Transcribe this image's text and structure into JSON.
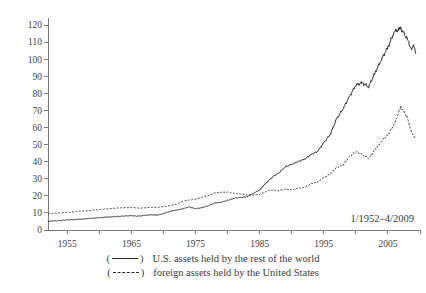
{
  "chart_data": {
    "type": "line",
    "title": "",
    "subtitle": "",
    "annotation": "1/1952–4/2009",
    "xlabel": "",
    "ylabel": "",
    "xlim": [
      1952,
      2010
    ],
    "ylim": [
      0,
      125
    ],
    "grid": false,
    "legend_position": "bottom-center",
    "yticks": [
      0,
      10,
      20,
      30,
      40,
      50,
      60,
      70,
      80,
      90,
      100,
      110,
      120
    ],
    "ytick_labels": [
      "0",
      "10",
      "20",
      "30",
      "40",
      "50",
      "60",
      "70",
      "80",
      "90",
      "100",
      "110",
      "120"
    ],
    "xticks": [
      1955,
      1960,
      1965,
      1970,
      1975,
      1980,
      1985,
      1990,
      1995,
      2000,
      2005,
      2010
    ],
    "xtick_labels": [
      "1955",
      "",
      "1965",
      "",
      "1975",
      "",
      "1985",
      "",
      "1995",
      "",
      "2005",
      ""
    ],
    "series": [
      {
        "name": "U.S. assets held by the rest of the world",
        "style": "solid",
        "x": [
          1952,
          1953,
          1954,
          1955,
          1956,
          1957,
          1958,
          1959,
          1960,
          1961,
          1962,
          1963,
          1964,
          1965,
          1966,
          1967,
          1968,
          1969,
          1970,
          1971,
          1972,
          1973,
          1974,
          1975,
          1976,
          1977,
          1978,
          1979,
          1980,
          1981,
          1982,
          1983,
          1984,
          1985,
          1986,
          1987,
          1988,
          1989,
          1990,
          1991,
          1992,
          1993,
          1994,
          1995,
          1996,
          1997,
          1998,
          1999,
          2000,
          2001,
          2002,
          2003,
          2004,
          2005,
          2006,
          2007,
          2008,
          2008.6,
          2009.0,
          2009.33
        ],
        "values": [
          5.1,
          5.3,
          5.6,
          5.9,
          6.1,
          6.3,
          6.6,
          6.9,
          7.2,
          7.5,
          7.7,
          7.9,
          8.2,
          8.4,
          8.1,
          8.5,
          8.9,
          8.7,
          9.5,
          11.0,
          11.6,
          12.4,
          13.5,
          12.5,
          13.0,
          14.2,
          15.8,
          16.2,
          17.3,
          18.6,
          19.0,
          19.4,
          21.4,
          23.5,
          27.5,
          31.0,
          33.5,
          37.0,
          38.5,
          40.0,
          41.5,
          44.0,
          46.0,
          51.0,
          56.0,
          65.0,
          71.0,
          78.0,
          85.0,
          86.0,
          84.0,
          92.0,
          100.0,
          107.0,
          116.0,
          118.0,
          112.0,
          106.0,
          108.0,
          103.5
        ]
      },
      {
        "name": "foreign assets held by the United States",
        "style": "dashed",
        "x": [
          1952,
          1953,
          1954,
          1955,
          1956,
          1957,
          1958,
          1959,
          1960,
          1961,
          1962,
          1963,
          1964,
          1965,
          1966,
          1967,
          1968,
          1969,
          1970,
          1971,
          1972,
          1973,
          1974,
          1975,
          1976,
          1977,
          1978,
          1979,
          1980,
          1981,
          1982,
          1983,
          1984,
          1985,
          1986,
          1987,
          1988,
          1989,
          1990,
          1991,
          1992,
          1993,
          1994,
          1995,
          1996,
          1997,
          1998,
          1999,
          2000,
          2001,
          2002,
          2003,
          2004,
          2005,
          2006,
          2007,
          2008,
          2008.6,
          2009.0,
          2009.33
        ],
        "values": [
          9.5,
          9.8,
          10.0,
          10.3,
          10.6,
          11.0,
          11.3,
          11.6,
          12.0,
          12.3,
          12.6,
          12.9,
          13.1,
          13.2,
          12.8,
          13.0,
          13.2,
          13.3,
          13.6,
          14.3,
          15.1,
          16.8,
          17.5,
          18.2,
          19.0,
          20.2,
          21.6,
          22.2,
          22.0,
          21.5,
          21.0,
          20.6,
          20.4,
          21.0,
          22.5,
          23.5,
          23.0,
          24.0,
          23.5,
          24.5,
          25.0,
          27.0,
          28.0,
          30.5,
          33.0,
          36.5,
          38.0,
          43.0,
          46.0,
          44.0,
          42.0,
          47.0,
          52.0,
          56.0,
          62.0,
          72.0,
          66.0,
          58.0,
          55.0,
          53.0
        ]
      }
    ]
  },
  "legend": {
    "items": [
      {
        "open_paren": "(",
        "close_paren": ")",
        "style": "solid",
        "label": "U.S. assets held by the rest of the world"
      },
      {
        "open_paren": "(",
        "close_paren": ")",
        "style": "dashed",
        "label": "foreign assets held by the United States"
      }
    ]
  },
  "colors": {
    "line": "#2e2e2e",
    "axis": "#6f6f6f",
    "text": "#3a3a3a",
    "background": "#ffffff"
  }
}
